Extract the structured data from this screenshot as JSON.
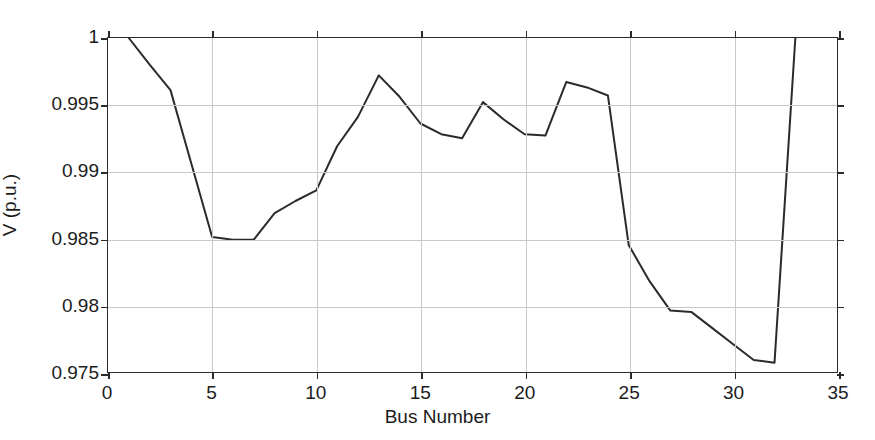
{
  "chart_data": {
    "type": "line",
    "title": "",
    "xlabel": "Bus Number",
    "ylabel": "V (p.u.)",
    "xlim": [
      0,
      35
    ],
    "ylim": [
      0.975,
      1
    ],
    "xticks": [
      "0",
      "5",
      "10",
      "15",
      "20",
      "25",
      "30",
      "35"
    ],
    "xtick_values": [
      0,
      5,
      10,
      15,
      20,
      25,
      30,
      35
    ],
    "yticks": [
      "0.975",
      "0.98",
      "0.985",
      "0.99",
      "0.995",
      "1"
    ],
    "ytick_values": [
      0.975,
      0.98,
      0.985,
      0.99,
      0.995,
      1.0
    ],
    "grid": true,
    "legend": null,
    "line_color": "#2b2b2b",
    "line_width": 2,
    "series": [
      {
        "name": "Bus voltage",
        "x": [
          1,
          2,
          3,
          4,
          5,
          6,
          7,
          8,
          9,
          10,
          11,
          12,
          13,
          14,
          15,
          16,
          17,
          18,
          19,
          20,
          21,
          22,
          23,
          24,
          25,
          26,
          27,
          28,
          29,
          30,
          31,
          32,
          33
        ],
        "values": [
          1.0,
          0.998,
          0.9961,
          0.9906,
          0.9851,
          0.9849,
          0.9849,
          0.9869,
          0.9878,
          0.9886,
          0.9919,
          0.9941,
          0.9972,
          0.9956,
          0.9936,
          0.9928,
          0.9925,
          0.9952,
          0.9939,
          0.9928,
          0.9927,
          0.9967,
          0.9963,
          0.9957,
          0.9845,
          0.9818,
          0.9796,
          0.9795,
          0.9783,
          0.9771,
          0.9759,
          0.9757,
          1.0
        ]
      }
    ]
  }
}
